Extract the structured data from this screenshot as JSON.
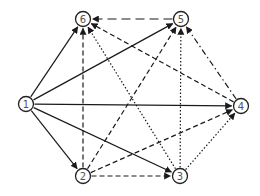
{
  "diagram": {
    "type": "directed-graph",
    "node_radius": 7.5,
    "colors": {
      "stroke": "#1a1a1a",
      "node_border": "#222222",
      "label": "#555555",
      "background": "#ffffff"
    },
    "nodes": [
      {
        "id": "1",
        "label": "1",
        "x": 26,
        "y": 104
      },
      {
        "id": "2",
        "label": "2",
        "x": 83,
        "y": 176
      },
      {
        "id": "3",
        "label": "3",
        "x": 180,
        "y": 176
      },
      {
        "id": "4",
        "label": "4",
        "x": 241,
        "y": 106
      },
      {
        "id": "5",
        "label": "5",
        "x": 181,
        "y": 19
      },
      {
        "id": "6",
        "label": "6",
        "x": 83,
        "y": 19
      }
    ],
    "edge_styles": {
      "solid": "",
      "dashed": "5,3",
      "dotted": "1.5,2",
      "dashdot": "6,3,1.5,3",
      "longdash": "9,5"
    },
    "edges": [
      {
        "from": "1",
        "to": "2",
        "style": "solid"
      },
      {
        "from": "1",
        "to": "3",
        "style": "solid"
      },
      {
        "from": "1",
        "to": "4",
        "style": "solid"
      },
      {
        "from": "1",
        "to": "5",
        "style": "solid"
      },
      {
        "from": "1",
        "to": "6",
        "style": "solid"
      },
      {
        "from": "2",
        "to": "3",
        "style": "dashed"
      },
      {
        "from": "2",
        "to": "4",
        "style": "dashed"
      },
      {
        "from": "2",
        "to": "5",
        "style": "dashed"
      },
      {
        "from": "2",
        "to": "6",
        "style": "dashed"
      },
      {
        "from": "3",
        "to": "4",
        "style": "dotted"
      },
      {
        "from": "3",
        "to": "5",
        "style": "dotted"
      },
      {
        "from": "3",
        "to": "6",
        "style": "dotted"
      },
      {
        "from": "4",
        "to": "5",
        "style": "dashdot"
      },
      {
        "from": "4",
        "to": "6",
        "style": "dashed"
      },
      {
        "from": "5",
        "to": "6",
        "style": "longdash"
      }
    ]
  }
}
